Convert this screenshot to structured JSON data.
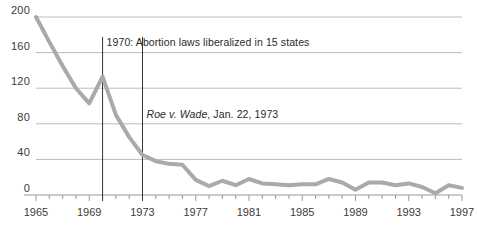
{
  "chart_data": {
    "type": "line",
    "title": "",
    "subtitle": "",
    "xlabel": "",
    "ylabel": "",
    "xlim": [
      1965,
      1997
    ],
    "ylim": [
      0,
      200
    ],
    "grid": true,
    "legend": null,
    "x_tick_labels": [
      "1965",
      "1969",
      "1973",
      "1977",
      "1981",
      "1985",
      "1989",
      "1993",
      "1997"
    ],
    "x_tick_values": [
      1965,
      1969,
      1973,
      1977,
      1981,
      1985,
      1989,
      1993,
      1997
    ],
    "x_minor_ticks_every": 1,
    "y_tick_labels": [
      "200",
      "160",
      "120",
      "80",
      "40",
      "0"
    ],
    "y_tick_values": [
      200,
      160,
      120,
      80,
      40,
      0
    ],
    "line_color": "#aaaaaa",
    "line_width": 4,
    "x": [
      1965,
      1966,
      1967,
      1968,
      1969,
      1970,
      1971,
      1972,
      1973,
      1974,
      1975,
      1976,
      1977,
      1978,
      1979,
      1980,
      1981,
      1982,
      1983,
      1984,
      1985,
      1986,
      1987,
      1988,
      1989,
      1990,
      1991,
      1992,
      1993,
      1994,
      1995,
      1996,
      1997
    ],
    "values": [
      200,
      172,
      145,
      120,
      103,
      133,
      90,
      65,
      45,
      38,
      35,
      34,
      17,
      10,
      16,
      11,
      18,
      13,
      12,
      11,
      12,
      12,
      18,
      14,
      6,
      14,
      14,
      11,
      13,
      9,
      2,
      11,
      8
    ],
    "annotations": [
      {
        "id": "annot-1970",
        "x_value": 1970,
        "text": "1970: Abortion laws liberalized in 15 states",
        "italic_prefix": "",
        "line_color": "#333333"
      },
      {
        "id": "annot-1973",
        "x_value": 1973,
        "text": ", Jan. 22, 1973",
        "italic_prefix": "Roe v. Wade",
        "line_color": "#333333"
      }
    ]
  },
  "axis": {
    "gridline_color": "#bbbbbb",
    "axis_color": "#999999",
    "tick_color": "#999999",
    "label_color": "#3a3a3a"
  }
}
